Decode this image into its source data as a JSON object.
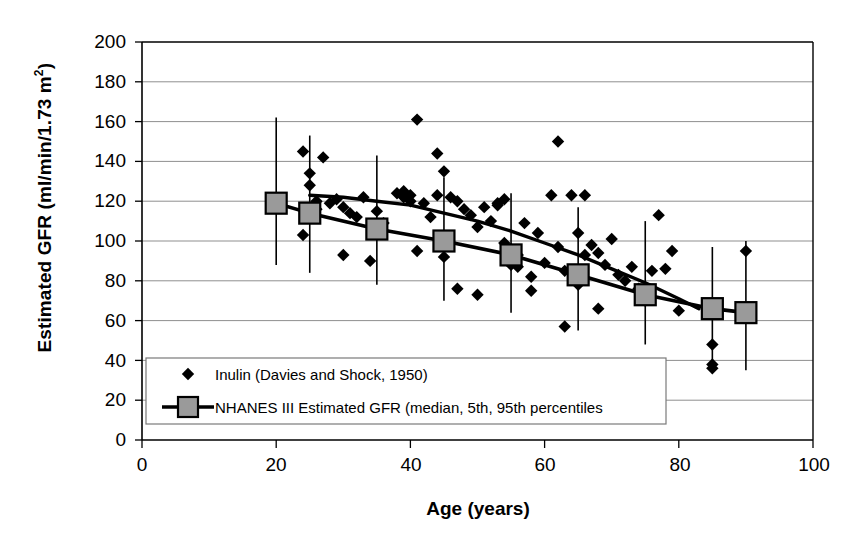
{
  "chart_data": {
    "type": "scatter",
    "title": "",
    "xlabel": "Age (years)",
    "ylabel": "Estimated GFR (ml/min/1.73 m2)",
    "ylabel_main": "Estimated GFR (ml/min/1.73 m",
    "ylabel_sup": "2",
    "ylabel_close": ")",
    "xlim": [
      0,
      100
    ],
    "ylim": [
      0,
      200
    ],
    "xticks": [
      0,
      20,
      40,
      60,
      80,
      100
    ],
    "yticks": [
      0,
      20,
      40,
      60,
      80,
      100,
      120,
      140,
      160,
      180,
      200
    ],
    "grid": "horizontal",
    "legend_position": "bottom-left-inside",
    "legend": [
      {
        "label": "Inulin (Davies and Shock, 1950)",
        "marker": "diamond",
        "color": "#000000"
      },
      {
        "label": "NHANES III Estimated GFR (median, 5th, 95th percentiles",
        "marker": "square-line",
        "color": "#808080"
      }
    ],
    "series": [
      {
        "name": "Inulin (Davies and Shock, 1950)",
        "type": "scatter",
        "marker": "diamond",
        "color": "#000000",
        "points": [
          [
            24,
            145
          ],
          [
            25,
            134
          ],
          [
            25,
            128
          ],
          [
            26,
            120
          ],
          [
            26,
            116
          ],
          [
            24,
            103
          ],
          [
            27,
            142
          ],
          [
            28,
            119
          ],
          [
            29,
            121
          ],
          [
            30,
            117
          ],
          [
            30,
            93
          ],
          [
            31,
            114
          ],
          [
            32,
            112
          ],
          [
            33,
            122
          ],
          [
            34,
            90
          ],
          [
            35,
            115
          ],
          [
            36,
            109
          ],
          [
            38,
            124
          ],
          [
            39,
            122
          ],
          [
            39,
            125
          ],
          [
            40,
            123
          ],
          [
            40,
            120
          ],
          [
            41,
            161
          ],
          [
            41,
            95
          ],
          [
            42,
            119
          ],
          [
            43,
            112
          ],
          [
            44,
            144
          ],
          [
            44,
            123
          ],
          [
            45,
            135
          ],
          [
            45,
            92
          ],
          [
            46,
            122
          ],
          [
            47,
            120
          ],
          [
            47,
            76
          ],
          [
            48,
            116
          ],
          [
            49,
            113
          ],
          [
            50,
            107
          ],
          [
            50,
            73
          ],
          [
            51,
            117
          ],
          [
            52,
            110
          ],
          [
            53,
            119
          ],
          [
            53,
            118
          ],
          [
            54,
            121
          ],
          [
            54,
            99
          ],
          [
            55,
            96
          ],
          [
            55,
            88
          ],
          [
            55,
            91
          ],
          [
            56,
            93
          ],
          [
            56,
            87
          ],
          [
            57,
            109
          ],
          [
            58,
            82
          ],
          [
            58,
            75
          ],
          [
            59,
            104
          ],
          [
            60,
            89
          ],
          [
            61,
            123
          ],
          [
            62,
            150
          ],
          [
            62,
            97
          ],
          [
            63,
            85
          ],
          [
            63,
            57
          ],
          [
            64,
            123
          ],
          [
            65,
            104
          ],
          [
            65,
            78
          ],
          [
            66,
            123
          ],
          [
            66,
            93
          ],
          [
            67,
            98
          ],
          [
            68,
            94
          ],
          [
            68,
            66
          ],
          [
            69,
            88
          ],
          [
            70,
            101
          ],
          [
            71,
            83
          ],
          [
            72,
            80
          ],
          [
            73,
            87
          ],
          [
            74,
            76
          ],
          [
            75,
            70
          ],
          [
            76,
            85
          ],
          [
            77,
            113
          ],
          [
            78,
            86
          ],
          [
            79,
            95
          ],
          [
            80,
            65
          ],
          [
            85,
            48
          ],
          [
            85,
            38
          ],
          [
            85,
            36
          ],
          [
            90,
            95
          ],
          [
            90,
            63
          ]
        ]
      },
      {
        "name": "NHANES III Estimated GFR (median, 5th, 95th percentiles",
        "type": "line-marker-errorbar",
        "marker": "square",
        "marker_color": "#9a9a9a",
        "line_color": "#000000",
        "x": [
          20,
          25,
          35,
          45,
          55,
          65,
          75,
          85,
          90
        ],
        "median": [
          119,
          114,
          106,
          100,
          93,
          83,
          73,
          66,
          64
        ],
        "p5": [
          88,
          84,
          78,
          70,
          64,
          55,
          48,
          36,
          35
        ],
        "p95": [
          162,
          153,
          143,
          132,
          124,
          117,
          110,
          97,
          100
        ]
      },
      {
        "name": "Inulin regression curve",
        "type": "trend-line",
        "color": "#000000",
        "points": [
          [
            25,
            123
          ],
          [
            30,
            122
          ],
          [
            35,
            120
          ],
          [
            40,
            118
          ],
          [
            45,
            114
          ],
          [
            50,
            110
          ],
          [
            55,
            105
          ],
          [
            60,
            99
          ],
          [
            65,
            93
          ],
          [
            70,
            86
          ],
          [
            75,
            79
          ],
          [
            80,
            71
          ],
          [
            83,
            66
          ]
        ]
      }
    ]
  },
  "axes": {
    "x_tick_labels": [
      "0",
      "20",
      "40",
      "60",
      "80",
      "100"
    ],
    "y_tick_labels": [
      "0",
      "20",
      "40",
      "60",
      "80",
      "100",
      "120",
      "140",
      "160",
      "180",
      "200"
    ]
  }
}
